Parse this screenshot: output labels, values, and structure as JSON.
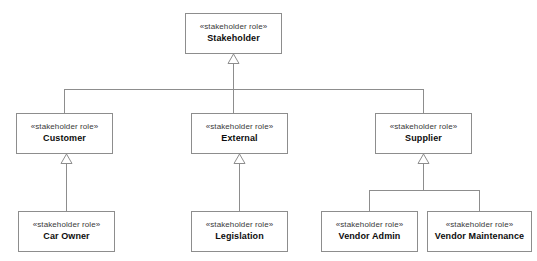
{
  "diagram": {
    "type": "uml-class-diagram",
    "notation": "generalization",
    "stereotype_label": "«stakeholder role»",
    "line_color": "#8d8d8d",
    "background_color": "#ffffff",
    "text_color": "#0d0d0d",
    "nodes": [
      {
        "id": "stakeholder",
        "name": "Stakeholder",
        "stereotype": "«stakeholder role»",
        "x": 185,
        "y": 13,
        "w": 97,
        "h": 41,
        "level": 0
      },
      {
        "id": "customer",
        "name": "Customer",
        "stereotype": "«stakeholder role»",
        "x": 16,
        "y": 113,
        "w": 97,
        "h": 41,
        "level": 1
      },
      {
        "id": "external",
        "name": "External",
        "stereotype": "«stakeholder role»",
        "x": 191,
        "y": 113,
        "w": 97,
        "h": 41,
        "level": 1
      },
      {
        "id": "supplier",
        "name": "Supplier",
        "stereotype": "«stakeholder role»",
        "x": 375,
        "y": 113,
        "w": 97,
        "h": 41,
        "level": 1
      },
      {
        "id": "car-owner",
        "name": "Car Owner",
        "stereotype": "«stakeholder role»",
        "x": 18,
        "y": 211,
        "w": 97,
        "h": 41,
        "level": 2
      },
      {
        "id": "legislation",
        "name": "Legislation",
        "stereotype": "«stakeholder role»",
        "x": 191,
        "y": 211,
        "w": 97,
        "h": 41,
        "level": 2
      },
      {
        "id": "vendor-admin",
        "name": "Vendor Admin",
        "stereotype": "«stakeholder role»",
        "x": 321,
        "y": 211,
        "w": 97,
        "h": 41,
        "level": 2
      },
      {
        "id": "vendor-maintenance",
        "name": "Vendor Maintenance",
        "stereotype": "«stakeholder role»",
        "x": 427,
        "y": 211,
        "w": 105,
        "h": 41,
        "level": 2
      }
    ],
    "edges": [
      {
        "from": "customer",
        "to": "stakeholder",
        "arrow": "hollow-triangle"
      },
      {
        "from": "external",
        "to": "stakeholder",
        "arrow": "hollow-triangle"
      },
      {
        "from": "supplier",
        "to": "stakeholder",
        "arrow": "hollow-triangle"
      },
      {
        "from": "car-owner",
        "to": "customer",
        "arrow": "hollow-triangle"
      },
      {
        "from": "legislation",
        "to": "external",
        "arrow": "hollow-triangle"
      },
      {
        "from": "vendor-admin",
        "to": "supplier",
        "arrow": "hollow-triangle"
      },
      {
        "from": "vendor-maintenance",
        "to": "supplier",
        "arrow": "hollow-triangle"
      }
    ]
  }
}
